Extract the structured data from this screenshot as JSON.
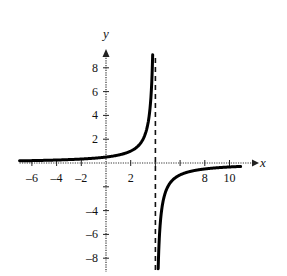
{
  "chart_data": {
    "type": "line",
    "title": "",
    "xlabel": "x",
    "ylabel": "y",
    "xlim": [
      -7,
      11.5
    ],
    "ylim": [
      -9,
      9.5
    ],
    "grid": false,
    "x_ticks": [
      -6,
      -4,
      -2,
      2,
      4,
      6,
      8,
      10
    ],
    "x_tick_labels": [
      "-6",
      "-4",
      "-2",
      "2",
      "",
      "",
      "8",
      "10"
    ],
    "y_ticks": [
      -8,
      -6,
      -4,
      -2,
      2,
      4,
      6,
      8
    ],
    "y_tick_labels": [
      "-8",
      "-6",
      "-4",
      "",
      "2",
      "4",
      "6",
      "8"
    ],
    "function": "y = 2/(4 - x)",
    "vertical_asymptote": 4,
    "horizontal_asymptote": 0,
    "series": [
      {
        "name": "f(x) left branch",
        "x": [
          -7,
          -6,
          -4,
          -2,
          0,
          1,
          2,
          3,
          3.5,
          3.78
        ],
        "y": [
          0.18,
          0.2,
          0.25,
          0.33,
          0.5,
          0.67,
          1,
          2,
          4,
          9
        ]
      },
      {
        "name": "f(x) right branch",
        "x": [
          4.22,
          4.5,
          5,
          6,
          8,
          10,
          11
        ],
        "y": [
          -9,
          -4,
          -2,
          -1,
          -0.5,
          -0.33,
          -0.29
        ]
      }
    ],
    "colors": {
      "curve": "#000000",
      "axes": "#333333",
      "asymptote": "#111111"
    }
  }
}
